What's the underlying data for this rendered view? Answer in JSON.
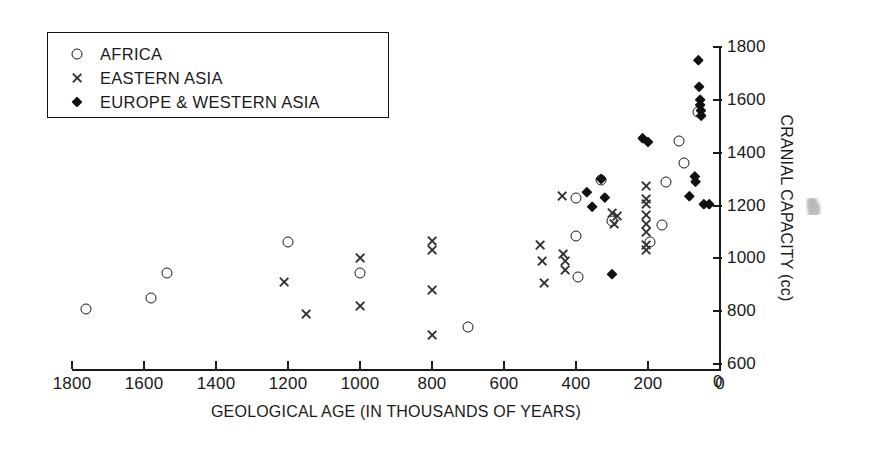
{
  "chart_data": {
    "type": "scatter",
    "title": "",
    "xlabel": "GEOLOGICAL AGE (IN THOUSANDS OF YEARS)",
    "ylabel": "CRANIAL CAPACITY (cc)",
    "xlim": [
      1800,
      0
    ],
    "ylim": [
      600,
      1800
    ],
    "x_ticks": [
      1800,
      1600,
      1400,
      1200,
      1000,
      800,
      600,
      400,
      200,
      0
    ],
    "y_ticks": [
      600,
      800,
      1000,
      1200,
      1400,
      1600,
      1800
    ],
    "y_axis_position": "right",
    "x_axis_reversed": true,
    "y_origin_label": "0",
    "grid": false,
    "legend_position": "top-left",
    "series": [
      {
        "name": "AFRICA",
        "marker": "circle",
        "marker_style": "open",
        "points": [
          {
            "x": 1760,
            "y": 810
          },
          {
            "x": 1580,
            "y": 850
          },
          {
            "x": 1535,
            "y": 945
          },
          {
            "x": 1200,
            "y": 1060
          },
          {
            "x": 1000,
            "y": 945
          },
          {
            "x": 700,
            "y": 740
          },
          {
            "x": 400,
            "y": 1230
          },
          {
            "x": 400,
            "y": 1085
          },
          {
            "x": 395,
            "y": 930
          },
          {
            "x": 330,
            "y": 1295
          },
          {
            "x": 300,
            "y": 1140
          },
          {
            "x": 195,
            "y": 1060
          },
          {
            "x": 160,
            "y": 1125
          },
          {
            "x": 150,
            "y": 1290
          },
          {
            "x": 115,
            "y": 1445
          },
          {
            "x": 100,
            "y": 1360
          },
          {
            "x": 60,
            "y": 1555
          }
        ]
      },
      {
        "name": "EASTERN ASIA",
        "marker": "cross",
        "marker_style": "x",
        "points": [
          {
            "x": 1210,
            "y": 910
          },
          {
            "x": 1150,
            "y": 790
          },
          {
            "x": 1000,
            "y": 1000
          },
          {
            "x": 1000,
            "y": 820
          },
          {
            "x": 800,
            "y": 1065
          },
          {
            "x": 800,
            "y": 1030
          },
          {
            "x": 800,
            "y": 880
          },
          {
            "x": 800,
            "y": 710
          },
          {
            "x": 500,
            "y": 1050
          },
          {
            "x": 495,
            "y": 990
          },
          {
            "x": 490,
            "y": 905
          },
          {
            "x": 440,
            "y": 1235
          },
          {
            "x": 435,
            "y": 1015
          },
          {
            "x": 430,
            "y": 990
          },
          {
            "x": 430,
            "y": 955
          },
          {
            "x": 300,
            "y": 1170
          },
          {
            "x": 295,
            "y": 1130
          },
          {
            "x": 285,
            "y": 1160
          },
          {
            "x": 205,
            "y": 1275
          },
          {
            "x": 205,
            "y": 1225
          },
          {
            "x": 205,
            "y": 1205
          },
          {
            "x": 205,
            "y": 1165
          },
          {
            "x": 205,
            "y": 1130
          },
          {
            "x": 205,
            "y": 1100
          },
          {
            "x": 205,
            "y": 1050
          },
          {
            "x": 205,
            "y": 1030
          }
        ]
      },
      {
        "name": "EUROPE & WESTERN ASIA",
        "marker": "diamond",
        "marker_style": "filled",
        "points": [
          {
            "x": 370,
            "y": 1250
          },
          {
            "x": 355,
            "y": 1195
          },
          {
            "x": 330,
            "y": 1300
          },
          {
            "x": 320,
            "y": 1230
          },
          {
            "x": 300,
            "y": 940
          },
          {
            "x": 215,
            "y": 1455
          },
          {
            "x": 200,
            "y": 1440
          },
          {
            "x": 85,
            "y": 1235
          },
          {
            "x": 70,
            "y": 1310
          },
          {
            "x": 68,
            "y": 1290
          },
          {
            "x": 60,
            "y": 1750
          },
          {
            "x": 58,
            "y": 1650
          },
          {
            "x": 55,
            "y": 1600
          },
          {
            "x": 55,
            "y": 1580
          },
          {
            "x": 53,
            "y": 1560
          },
          {
            "x": 52,
            "y": 1540
          },
          {
            "x": 45,
            "y": 1205
          },
          {
            "x": 30,
            "y": 1205
          }
        ]
      }
    ]
  },
  "legend": {
    "entries": [
      {
        "label": "AFRICA",
        "marker": "circle"
      },
      {
        "label": "EASTERN ASIA",
        "marker": "cross"
      },
      {
        "label": "EUROPE & WESTERN ASIA",
        "marker": "diamond"
      }
    ]
  }
}
